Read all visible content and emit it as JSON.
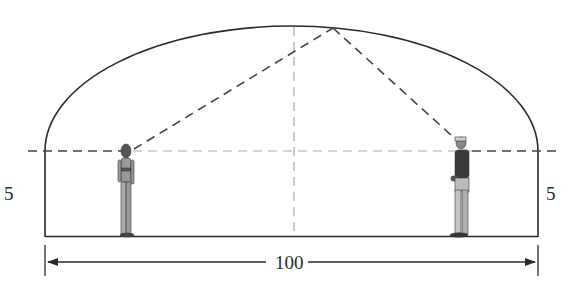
{
  "diagram": {
    "labels": {
      "left_wall_height": "5",
      "right_wall_height": "5",
      "span_width": "100"
    },
    "figures": [
      {
        "name": "woman",
        "position": "left focus"
      },
      {
        "name": "man",
        "position": "right focus"
      }
    ],
    "colors": {
      "line": "#2a2a2a",
      "dashed": "#555555",
      "figure": "#6b6b6b"
    }
  }
}
